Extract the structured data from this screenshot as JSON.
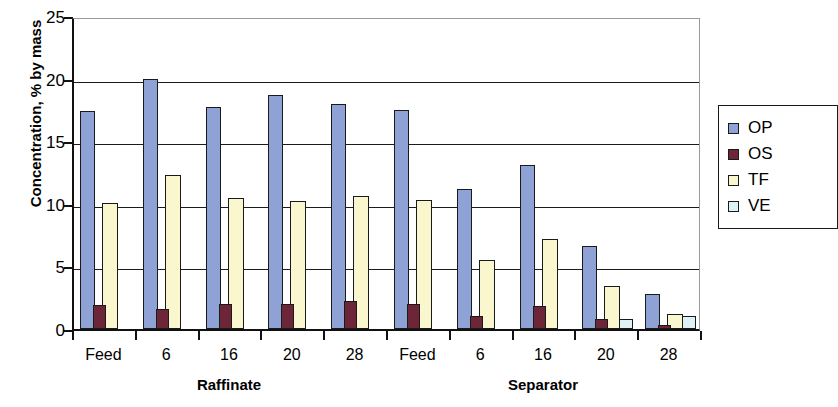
{
  "chart_data": {
    "type": "bar",
    "title": "",
    "xlabel": "",
    "ylabel": "Concentration, % by mass",
    "ylim": [
      0,
      25
    ],
    "yticks": [
      0,
      5,
      10,
      15,
      20,
      25
    ],
    "grid": true,
    "legend_position": "right",
    "group_labels": [
      "Raffinate",
      "Separator"
    ],
    "categories": [
      "Feed",
      "6",
      "16",
      "20",
      "28",
      "Feed",
      "6",
      "16",
      "20",
      "28"
    ],
    "series": [
      {
        "name": "OP",
        "color": "#8fa2d6",
        "values": [
          17.4,
          20.0,
          17.7,
          18.7,
          18.0,
          17.5,
          11.2,
          13.1,
          6.6,
          2.8
        ]
      },
      {
        "name": "OS",
        "color": "#6d2637",
        "values": [
          1.9,
          1.6,
          2.0,
          2.0,
          2.2,
          2.0,
          1.0,
          1.8,
          0.8,
          0.3
        ]
      },
      {
        "name": "TF",
        "color": "#faf7cf",
        "values": [
          10.1,
          12.3,
          10.5,
          10.2,
          10.6,
          10.3,
          5.5,
          7.2,
          3.4,
          1.2
        ]
      },
      {
        "name": "VE",
        "color": "#ddf1f7",
        "values": [
          0,
          0,
          0,
          0,
          0,
          0,
          0,
          0,
          0.8,
          1.0
        ]
      }
    ]
  },
  "legend": {
    "entries": [
      {
        "label": "OP",
        "color": "#8fa2d6"
      },
      {
        "label": "OS",
        "color": "#6d2637"
      },
      {
        "label": "TF",
        "color": "#faf7cf"
      },
      {
        "label": "VE",
        "color": "#ddf1f7"
      }
    ]
  }
}
